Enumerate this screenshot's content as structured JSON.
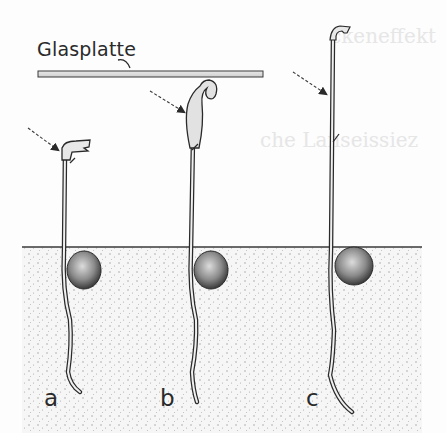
{
  "figure": {
    "plate_label": "Glasplatte",
    "seedlings": [
      {
        "id": "a",
        "label": "a"
      },
      {
        "id": "b",
        "label": "b"
      },
      {
        "id": "c",
        "label": "c"
      }
    ],
    "ghost_text": [
      "ckeneffekt",
      "moprhe",
      "che Lanseissiez"
    ]
  },
  "colors": {
    "ink": "#2a2a2a",
    "soil_bg": "#f4f4f4",
    "soil_dots": "#9a9a9a",
    "paper": "#fdfdfd"
  }
}
